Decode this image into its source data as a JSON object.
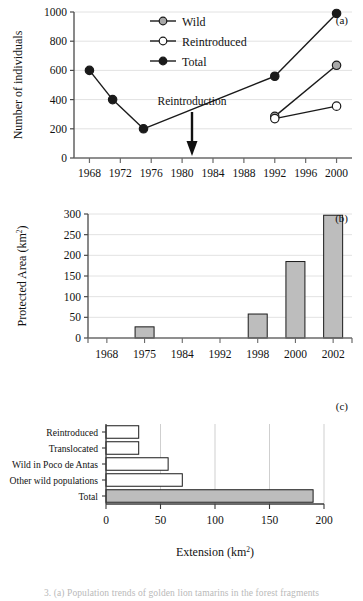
{
  "figure": {
    "caption_clipped": "3. (a) Population trends of golden lion tamarins in the forest fragments"
  },
  "panels": [
    {
      "id": "a",
      "label": "(a)"
    },
    {
      "id": "b",
      "label": "(b)"
    },
    {
      "id": "c",
      "label": "(c)"
    }
  ],
  "panel_a": {
    "label": "(a)",
    "ylabel": "Number of individuals",
    "annotation": "Reintroduction",
    "annotation_year": 1984,
    "legend": [
      {
        "name": "Wild",
        "marker": "circle-gray"
      },
      {
        "name": "Reintroduced",
        "marker": "circle-open"
      },
      {
        "name": "Total",
        "marker": "circle-filled"
      }
    ],
    "xticks": [
      1968,
      1972,
      1976,
      1980,
      1984,
      1988,
      1992,
      1996,
      2000
    ],
    "yticks": [
      0,
      200,
      400,
      600,
      800,
      1000
    ]
  },
  "panel_b": {
    "label": "(b)",
    "ylabel_main": "Protected Area (km",
    "ylabel_sup": "2",
    "ylabel_close": ")",
    "xticks": [
      "1968",
      "1975",
      "1984",
      "1992",
      "1998",
      "2000",
      "2002"
    ],
    "yticks": [
      0,
      50,
      100,
      150,
      200,
      250,
      300
    ]
  },
  "panel_c": {
    "label": "(c)",
    "xlabel_main": "Extension (km",
    "xlabel_sup": "2",
    "xlabel_close": ")",
    "xticks": [
      0,
      50,
      100,
      150,
      200
    ],
    "categories": [
      "Reintroduced",
      "Translocated",
      "Wild in Poco de Antas",
      "Other wild populations",
      "Total"
    ]
  },
  "colors": {
    "line": "#1a1a1a",
    "bar_fill": "#bdbdbd",
    "bar_stroke": "#1a1a1a",
    "wild_marker": "#a8a8a8",
    "reintroduced_marker": "#ffffff",
    "total_marker": "#1a1a1a",
    "grid": "#e2e2e2",
    "axis": "#4a4a4a",
    "text": "#111111"
  },
  "chart_data": [
    {
      "type": "line",
      "panel": "a",
      "title": "",
      "xlabel": "",
      "ylabel": "Number of individuals",
      "xlim": [
        1966,
        2002
      ],
      "ylim": [
        0,
        1000
      ],
      "xticks": [
        1968,
        1972,
        1976,
        1980,
        1984,
        1988,
        1992,
        1996,
        2000
      ],
      "yticks": [
        0,
        200,
        400,
        600,
        800,
        1000
      ],
      "grid": true,
      "legend_position": "top-center",
      "annotations": [
        {
          "text": "Reintroduction",
          "x": 1984,
          "y": 330,
          "arrow": "down"
        }
      ],
      "series": [
        {
          "name": "Total",
          "marker": "filled-black",
          "x": [
            1968,
            1971,
            1975,
            1992,
            2000
          ],
          "values": [
            600,
            400,
            200,
            560,
            990
          ]
        },
        {
          "name": "Wild",
          "marker": "filled-gray",
          "x": [
            1992,
            2000
          ],
          "values": [
            285,
            635
          ]
        },
        {
          "name": "Reintroduced",
          "marker": "open-white",
          "x": [
            1992,
            2000
          ],
          "values": [
            270,
            355
          ]
        }
      ]
    },
    {
      "type": "bar",
      "panel": "b",
      "title": "",
      "xlabel": "",
      "ylabel": "Protected Area (km2)",
      "categories": [
        "1968",
        "1975",
        "1984",
        "1992",
        "1998",
        "2000",
        "2002"
      ],
      "values": [
        0,
        27,
        0,
        0,
        58,
        185,
        297
      ],
      "ylim": [
        0,
        300
      ],
      "yticks": [
        0,
        50,
        100,
        150,
        200,
        250,
        300
      ],
      "grid": true
    },
    {
      "type": "bar",
      "panel": "c",
      "orientation": "horizontal",
      "title": "",
      "xlabel": "Extension (km2)",
      "ylabel": "",
      "categories": [
        "Reintroduced",
        "Translocated",
        "Wild in Poco de Antas",
        "Other wild populations",
        "Total"
      ],
      "values": [
        30,
        30,
        57,
        70,
        190
      ],
      "bar_fills": [
        "white",
        "white",
        "white",
        "white",
        "gray"
      ],
      "xlim": [
        0,
        200
      ],
      "xticks": [
        0,
        50,
        100,
        150,
        200
      ],
      "grid": true
    }
  ]
}
